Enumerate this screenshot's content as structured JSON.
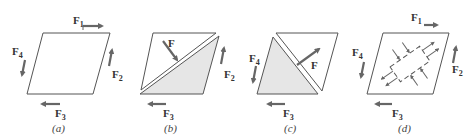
{
  "figure": {
    "panels": [
      {
        "id": "a",
        "caption": "(a)",
        "forces": [
          "F1",
          "F2",
          "F3",
          "F4"
        ],
        "description": "Parallelogram body loaded by four boundary forces"
      },
      {
        "id": "b",
        "caption": "(b)",
        "forces": [
          "F",
          "F2",
          "F3"
        ],
        "description": "Body cut along diagonal; lower-right part shaded with internal force F"
      },
      {
        "id": "c",
        "caption": "(c)",
        "forces": [
          "F",
          "F3",
          "F4"
        ],
        "description": "Body cut along other diagonal; lower-left part shaded with internal force F"
      },
      {
        "id": "d",
        "caption": "(d)",
        "forces": [
          "F1",
          "F2",
          "F3",
          "F4"
        ],
        "description": "Infinitesimal element inside body with stress arrows"
      }
    ],
    "labels": {
      "F": "F",
      "F1_main": "F",
      "F1_sub": "1",
      "F2_main": "F",
      "F2_sub": "2",
      "F3_main": "F",
      "F3_sub": "3",
      "F4_main": "F",
      "F4_sub": "4"
    },
    "captions": {
      "a": "(a)",
      "b": "(b)",
      "c": "(c)",
      "d": "(d)"
    },
    "colors": {
      "stroke": "#555555",
      "arrow": "#666666",
      "shade": "#e6e6e6"
    }
  }
}
